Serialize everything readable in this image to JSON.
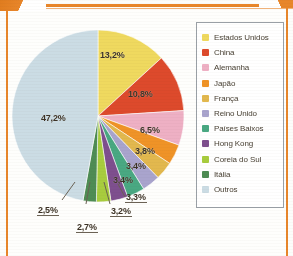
{
  "frame": {
    "accent_color": "#e8862a",
    "title_fragment": ""
  },
  "chart_data": {
    "type": "pie",
    "title": "",
    "xlabel": "",
    "ylabel": "",
    "legend_position": "right",
    "grid": false,
    "value_suffix": "%",
    "decimal_separator": ",",
    "categories": [
      "Estados Unidos",
      "China",
      "Alemanha",
      "Japão",
      "França",
      "Reino Unido",
      "Países Baixos",
      "Hong Kong",
      "Coreia do Sul",
      "Itália",
      "Outros"
    ],
    "values": [
      13.2,
      10.8,
      6.5,
      3.8,
      3.4,
      3.4,
      3.3,
      3.2,
      2.7,
      2.5,
      47.2
    ],
    "labels": [
      "13,2%",
      "10,8%",
      "6,5%",
      "3,8%",
      "3,4%",
      "3,4%",
      "3,3%",
      "3,2%",
      "2,7%",
      "2,5%",
      "47,2%"
    ],
    "colors": [
      "#efd95f",
      "#dd4a2c",
      "#eeb0c4",
      "#ef9327",
      "#e2b84e",
      "#a9a4cd",
      "#49a882",
      "#7e4f8e",
      "#a8cc3e",
      "#4e8c54",
      "#cbdce4"
    ]
  },
  "legend": {
    "items": [
      {
        "label": "Estados Unidos",
        "color": "#efd95f"
      },
      {
        "label": "China",
        "color": "#dd4a2c"
      },
      {
        "label": "Alemanha",
        "color": "#eeb0c4"
      },
      {
        "label": "Japão",
        "color": "#ef9327"
      },
      {
        "label": "França",
        "color": "#e2b84e"
      },
      {
        "label": "Reino Unido",
        "color": "#a9a4cd"
      },
      {
        "label": "Países Baixos",
        "color": "#49a882"
      },
      {
        "label": "Hong Kong",
        "color": "#7e4f8e"
      },
      {
        "label": "Coreia do Sul",
        "color": "#a8cc3e"
      },
      {
        "label": "Itália",
        "color": "#4e8c54"
      },
      {
        "label": "Outros",
        "color": "#cbdce4"
      }
    ]
  }
}
